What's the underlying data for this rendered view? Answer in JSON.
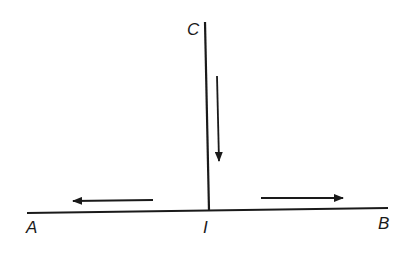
{
  "diagram": {
    "type": "T-junction flow diagram",
    "labels": {
      "top": "C",
      "left": "A",
      "junction": "I",
      "right": "B"
    },
    "lines": [
      {
        "name": "vertical-stem",
        "from": "C",
        "to": "I"
      },
      {
        "name": "horizontal-base",
        "from": "A",
        "to": "B"
      }
    ],
    "arrows": [
      {
        "name": "flow-down",
        "direction": "down",
        "along": "C to I"
      },
      {
        "name": "flow-left",
        "direction": "left",
        "along": "I to A"
      },
      {
        "name": "flow-right",
        "direction": "right",
        "along": "I to B"
      }
    ],
    "colors": {
      "stroke": "#1a1a1a",
      "background": "#ffffff"
    }
  }
}
